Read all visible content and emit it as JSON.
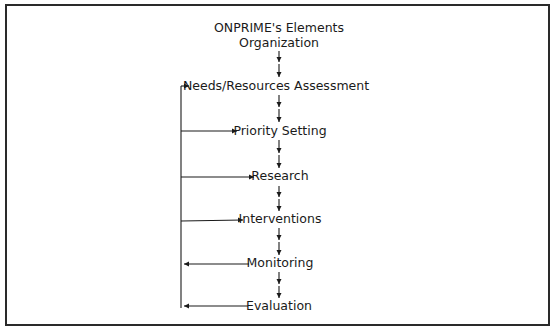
{
  "diagram": {
    "type": "flowchart",
    "title_lines": [
      "ONPRIME's Elements",
      "Organization"
    ],
    "steps": [
      {
        "id": "needs",
        "label": "Needs/Resources Assessment"
      },
      {
        "id": "priority",
        "label": "Priority Setting"
      },
      {
        "id": "research",
        "label": "Research"
      },
      {
        "id": "interventions",
        "label": "Interventions"
      },
      {
        "id": "monitoring",
        "label": "Monitoring"
      },
      {
        "id": "evaluation",
        "label": "Evaluation"
      }
    ],
    "flow": [
      {
        "from": "Organization",
        "to": "needs",
        "style": "double-down-arrow"
      },
      {
        "from": "needs",
        "to": "priority",
        "style": "double-down-arrow"
      },
      {
        "from": "priority",
        "to": "research",
        "style": "double-down-arrow"
      },
      {
        "from": "research",
        "to": "interventions",
        "style": "double-down-arrow"
      },
      {
        "from": "interventions",
        "to": "monitoring",
        "style": "double-down-arrow"
      },
      {
        "from": "monitoring",
        "to": "evaluation",
        "style": "double-down-arrow"
      }
    ],
    "feedback_loop": {
      "feeds_from": [
        "monitoring",
        "evaluation"
      ],
      "feeds_into": [
        "needs",
        "priority",
        "research",
        "interventions"
      ]
    },
    "colors": {
      "line": "#1a1a1a",
      "border": "#2a2a2a",
      "background": "#ffffff"
    }
  }
}
